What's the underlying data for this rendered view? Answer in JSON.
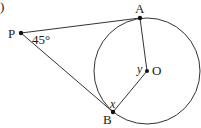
{
  "figure": {
    "part_label": ")",
    "points": {
      "P": {
        "label": "P",
        "x": 21,
        "y": 33
      },
      "A": {
        "label": "A",
        "x": 140,
        "y": 18
      },
      "B": {
        "label": "B",
        "x": 113,
        "y": 112
      },
      "O": {
        "label": "O",
        "x": 147,
        "y": 71
      }
    },
    "circle": {
      "cx": 147,
      "cy": 71,
      "r": 53
    },
    "angle_labels": {
      "P": "45°",
      "x": "x",
      "y": "y"
    },
    "colors": {
      "stroke": "#333333",
      "text": "#1a1a1a"
    }
  }
}
